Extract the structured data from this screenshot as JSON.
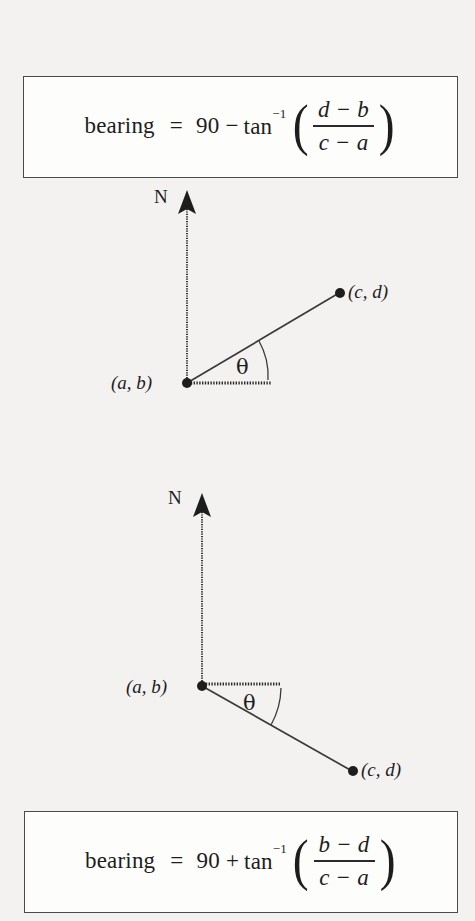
{
  "page": {
    "background_color": "#f3f2f0",
    "ink_color": "#1d1d1d",
    "width": 475,
    "height": 921
  },
  "formula_top": {
    "name": "bearing-formula-acute",
    "word": "bearing",
    "equals": "=",
    "constant": "90",
    "operator": "−",
    "trig": "tan",
    "exponent": "−1",
    "paren_open": "(",
    "paren_close": ")",
    "numerator": "d − b",
    "denominator": "c − a",
    "full_text": "bearing = 90 − tan⁻¹( (d − b) / (c − a) )"
  },
  "formula_bottom": {
    "name": "bearing-formula-obtuse",
    "word": "bearing",
    "equals": "=",
    "constant": "90",
    "operator": "+",
    "trig": "tan",
    "exponent": "−1",
    "paren_open": "(",
    "paren_close": ")",
    "numerator": "b − d",
    "denominator": "c − a",
    "full_text": "bearing = 90 + tan⁻¹( (b − d) / (c − a) )"
  },
  "diagram_top": {
    "name": "bearing-diagram-northeast",
    "north_label": "N",
    "origin_label": "(a, b)",
    "target_label": "(c, d)",
    "angle_label": "θ",
    "geometry": {
      "origin": [
        187,
        203
      ],
      "north_tip": [
        187,
        10
      ],
      "dotted_axis_end": [
        272,
        203
      ],
      "target_point": [
        340,
        113
      ],
      "arc_radius": 72
    }
  },
  "diagram_bottom": {
    "name": "bearing-diagram-southeast",
    "north_label": "N",
    "origin_label": "(a, b)",
    "target_label": "(c, d)",
    "angle_label": "θ",
    "geometry": {
      "origin": [
        202,
        206
      ],
      "north_tip": [
        202,
        13
      ],
      "dotted_axis_end": [
        281,
        204
      ],
      "target_point": [
        353,
        291
      ],
      "arc_radius": 79
    }
  }
}
